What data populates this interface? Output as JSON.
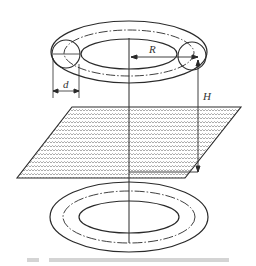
{
  "figure": {
    "labels": {
      "R": "R",
      "d": "d",
      "H": "H"
    },
    "caption": "",
    "colors": {
      "line": "#2a2a2a",
      "hatch": "#8a8a8a",
      "background": "#ffffff",
      "caption": "#d4d4d4"
    }
  }
}
